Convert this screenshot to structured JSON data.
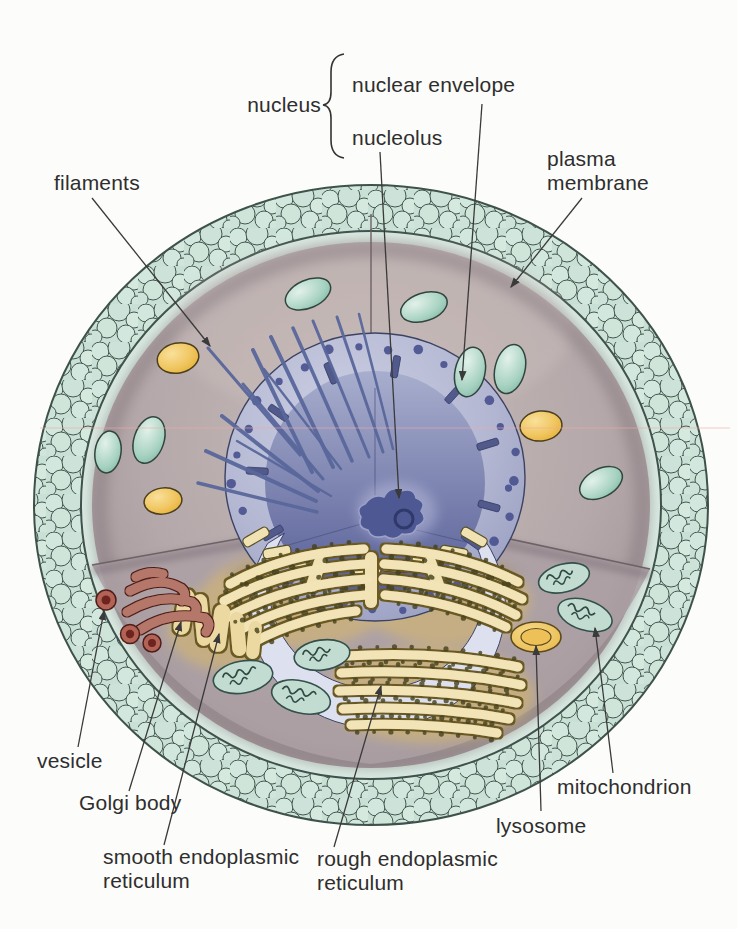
{
  "diagram": {
    "labels": {
      "nucleus": "nucleus",
      "nuclear_envelope": "nuclear envelope",
      "nucleolus": "nucleolus",
      "plasma_membrane_line1": "plasma",
      "plasma_membrane_line2": "membrane",
      "filaments": "filaments",
      "vesicle": "vesicle",
      "golgi_body": "Golgi body",
      "smooth_er_line1": "smooth endoplasmic",
      "smooth_er_line2": "reticulum",
      "rough_er_line1": "rough endoplasmic",
      "rough_er_line2": "reticulum",
      "lysosome": "lysosome",
      "mitochondrion": "mitochondrion"
    },
    "colors": {
      "membrane_bubbles": "#cfe4db",
      "membrane_outline": "#41564f",
      "membrane_inner_band": "#d9eae2",
      "cytoplasm": "#b5a8aa",
      "nuclear_envelope": "#b3b7d2",
      "nucleus_interior": "#7b82af",
      "nucleolus": "#4e5892",
      "er_membrane": "#f2e4b6",
      "er_wash": "#debb62",
      "golgi": "#b5776b",
      "vesicle": "#b26355",
      "mitochondrion_fill": "#c2dcd2",
      "lysosome_fill": "#eec35e",
      "oval_teal": "#a7d2c2",
      "oval_yellow": "#efc35a",
      "filament": "#59679b",
      "label_text": "#2e2e2e",
      "leader_line": "#3a3a3a",
      "scan_line": "#f2aaa6"
    }
  }
}
